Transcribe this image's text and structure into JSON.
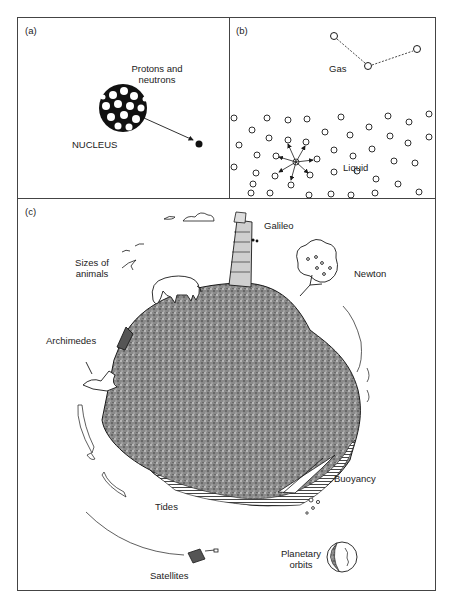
{
  "figure": {
    "panels": [
      {
        "id": "a",
        "tag": "(a)",
        "labels": {
          "protons": "Protons and",
          "neutrons": "neutrons",
          "nucleus": "NUCLEUS"
        }
      },
      {
        "id": "b",
        "tag": "(b)",
        "labels": {
          "gas": "Gas",
          "liquid": "Liquid"
        }
      },
      {
        "id": "c",
        "tag": "(c)",
        "labels": {
          "galileo": "Galileo",
          "newton": "Newton",
          "sizes_1": "Sizes of",
          "sizes_2": "animals",
          "archimedes": "Archimedes",
          "buoyancy": "Buoyancy",
          "tides": "Tides",
          "satellites": "Satellites",
          "planetary_1": "Planetary",
          "planetary_2": "orbits"
        }
      }
    ],
    "colors": {
      "ink": "#1a1a1a",
      "frame": "#444444",
      "earth_fill": "#7a7a7a",
      "background": "#ffffff"
    }
  }
}
